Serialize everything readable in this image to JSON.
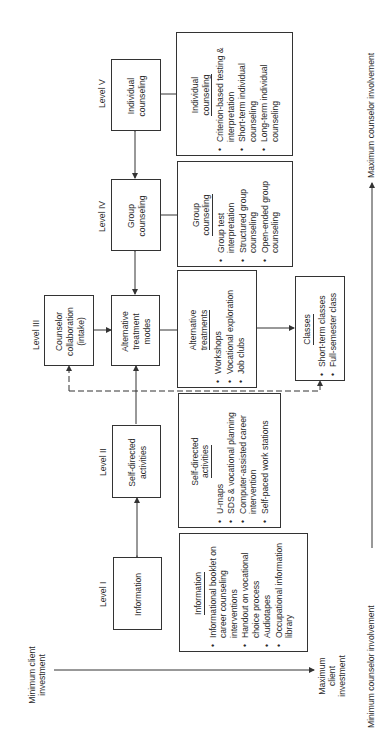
{
  "diagram": {
    "levels": [
      {
        "id": "level-1",
        "label": "Level I",
        "box_text": "Information"
      },
      {
        "id": "level-2",
        "label": "Level II",
        "box_text": "Self-directed activities"
      },
      {
        "id": "level-3",
        "label": "Level III",
        "box_text": "Counselor collaboration (intake)"
      },
      {
        "id": "level-3b",
        "label": "",
        "box_text": "Alternative treatment modes"
      },
      {
        "id": "level-4",
        "label": "Level IV",
        "box_text": "Group counseling"
      },
      {
        "id": "level-5",
        "label": "Level V",
        "box_text": "Individual counseling"
      }
    ],
    "details": {
      "information": {
        "title": "Information",
        "items": [
          "Informational booklet on career counseling interventions",
          "Handout on vocational choice process",
          "Audiotapes",
          "Occupational information library"
        ]
      },
      "self_directed": {
        "title_line1": "Self-directed",
        "title_line2": "activities",
        "items": [
          "U-maps",
          "SDS & vocational planning",
          "Computer-assisted career intervention",
          "Self-paced work stations"
        ]
      },
      "alternative": {
        "title_line1": "Alternative",
        "title_line2": "treatments",
        "items": [
          "Workshops",
          "Vocational exploration",
          "Job clubs"
        ]
      },
      "classes": {
        "title": "Classes",
        "items": [
          "Short-term classes",
          "Full-semester class"
        ]
      },
      "group": {
        "title_line1": "Group",
        "title_line2": "counseling",
        "items": [
          "Group test interpretation",
          "Structured group counseling",
          "Open-ended group counseling"
        ]
      },
      "individual": {
        "title_line1": "Individual",
        "title_line2": "counseling",
        "items": [
          "Criterion-based testing & interpretation",
          "Short-term individual counseling",
          "Long-term individual counseling"
        ]
      }
    },
    "axes": {
      "client_min": "Minimum client investment",
      "client_max": "Maximum client investment",
      "counselor_min": "Minimum counselor involvement",
      "counselor_max": "Maximum counselor involvement"
    }
  }
}
